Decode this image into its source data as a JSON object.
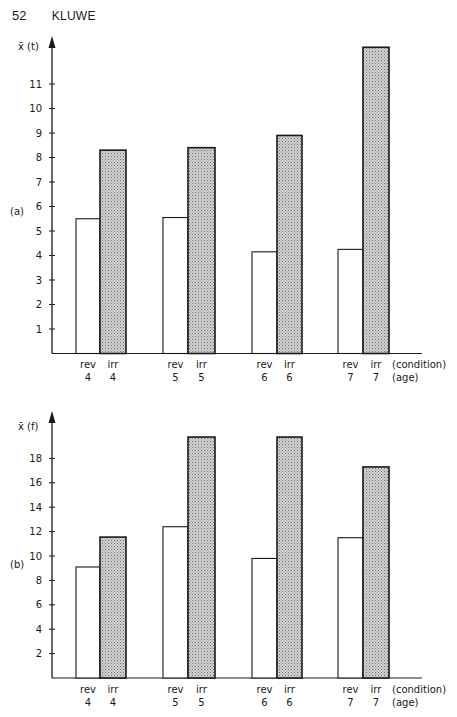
{
  "page": {
    "number": "52",
    "author": "KLUWE"
  },
  "chart_data": [
    {
      "type": "bar",
      "panel_label": "(a)",
      "ylabel": "x̄ (t)",
      "xlabel_row1": "(condition)",
      "xlabel_row2": "(age)",
      "yticks": [
        1,
        2,
        3,
        4,
        5,
        6,
        7,
        8,
        9,
        10,
        11
      ],
      "ylim": [
        0,
        12.7
      ],
      "categories": [
        "rev 4",
        "irr 4",
        "rev 5",
        "irr 5",
        "rev 6",
        "irr 6",
        "rev 7",
        "irr 7"
      ],
      "condition_labels": [
        "rev",
        "irr",
        "rev",
        "irr",
        "rev",
        "irr",
        "rev",
        "irr"
      ],
      "age_labels": [
        "4",
        "4",
        "5",
        "5",
        "6",
        "6",
        "7",
        "7"
      ],
      "series": [
        {
          "name": "rev (reversible)",
          "fill": "#ffffff",
          "ages": [
            4,
            5,
            6,
            7
          ],
          "values": [
            5.5,
            5.55,
            4.15,
            4.25
          ]
        },
        {
          "name": "irr (irreversible)",
          "fill": "stippled-gray",
          "ages": [
            4,
            5,
            6,
            7
          ],
          "values": [
            8.3,
            8.4,
            8.9,
            12.5
          ]
        }
      ],
      "grid": false,
      "legend": "none"
    },
    {
      "type": "bar",
      "panel_label": "(b)",
      "ylabel": "x̄ (f)",
      "xlabel_row1": "(condition)",
      "xlabel_row2": "(age)",
      "yticks": [
        2,
        4,
        6,
        8,
        10,
        12,
        14,
        16,
        18
      ],
      "ylim": [
        0,
        21.5
      ],
      "categories": [
        "rev 4",
        "irr 4",
        "rev 5",
        "irr 5",
        "rev 6",
        "irr 6",
        "rev 7",
        "irr 7"
      ],
      "condition_labels": [
        "rev",
        "irr",
        "rev",
        "irr",
        "rev",
        "irr",
        "rev",
        "irr"
      ],
      "age_labels": [
        "4",
        "4",
        "5",
        "5",
        "6",
        "6",
        "7",
        "7"
      ],
      "series": [
        {
          "name": "rev (reversible)",
          "fill": "#ffffff",
          "ages": [
            4,
            5,
            6,
            7
          ],
          "values": [
            9.1,
            12.4,
            9.8,
            11.5
          ]
        },
        {
          "name": "irr (irreversible)",
          "fill": "stippled-gray",
          "ages": [
            4,
            5,
            6,
            7
          ],
          "values": [
            11.55,
            19.75,
            19.75,
            17.3
          ]
        }
      ],
      "grid": false,
      "legend": "none"
    }
  ]
}
